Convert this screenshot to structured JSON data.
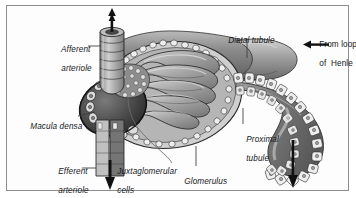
{
  "figure": {
    "kind": "anatomical-illustration",
    "style": "grayscale pen-and-ink medical illustration",
    "border_color": "#8d8d8d",
    "background_color": "#fdfdfd",
    "text_color": "#16181c"
  },
  "labels": [
    {
      "id": "afferent-arteriole",
      "line1": "Afferent",
      "line2": "arteriole",
      "style": "italic",
      "x": 47,
      "y": 36,
      "leader": "horizontal-right"
    },
    {
      "id": "distal-tubule",
      "line1": "Distal tubule",
      "line2": "",
      "style": "italic",
      "x": 214,
      "y": 27,
      "leader": "vertical-down"
    },
    {
      "id": "from-loop-of-henle",
      "line1": "From loop",
      "line2": "of  Henle",
      "style": "upright",
      "x": 305,
      "y": 31,
      "leader": "arrow-left"
    },
    {
      "id": "macula-densa",
      "line1": "Macula densa",
      "line2": "",
      "style": "italic",
      "x": 16,
      "y": 113,
      "leader": "horizontal-right"
    },
    {
      "id": "proximal-tubule",
      "line1": "Proximal",
      "line2": "tubule",
      "style": "italic",
      "x": 232,
      "y": 126,
      "leader": "vertical-up"
    },
    {
      "id": "efferent-arteriole",
      "line1": "Efferent",
      "line2": "arteriole",
      "style": "italic",
      "x": 44,
      "y": 158,
      "leader": "horizontal-right"
    },
    {
      "id": "juxtaglomerular-cells",
      "line1": "Juxtaglomerular",
      "line2": "cells",
      "style": "italic",
      "x": 103,
      "y": 158,
      "leader": "curve-up-left"
    },
    {
      "id": "glomerulus",
      "line1": "Glomerulus",
      "line2": "",
      "style": "italic",
      "x": 170,
      "y": 168,
      "leader": "vertical-up"
    }
  ],
  "flow_arrows": [
    {
      "id": "afferent-inflow-arrow",
      "direction": "down",
      "location": "top-center-left"
    },
    {
      "id": "henle-inflow-arrow",
      "direction": "left",
      "location": "top-right"
    },
    {
      "id": "efferent-outflow-arrow",
      "direction": "down",
      "location": "bottom-center-left"
    },
    {
      "id": "proximal-outflow-arrow",
      "direction": "down",
      "location": "bottom-right"
    }
  ],
  "structures": [
    "bowmans-capsule",
    "glomerular-capillary-tuft",
    "macula-densa-cells",
    "juxtaglomerular-cells",
    "afferent-arteriole-vessel",
    "efferent-arteriole-vessel",
    "distal-tubule-segment",
    "proximal-tubule-segment"
  ],
  "palette": {
    "ink": "#2a2a2a",
    "tissue_light": "#d3d3d3",
    "tissue_mid": "#a8a8a8",
    "tissue_dark": "#6e6e6e",
    "tissue_darkest": "#3c3c3c",
    "cell_fill": "#e6e6e6",
    "arrow": "#121212"
  }
}
